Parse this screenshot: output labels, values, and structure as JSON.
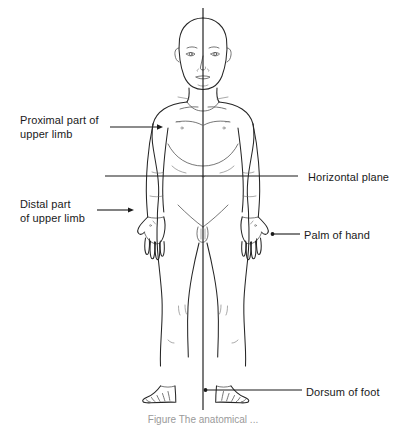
{
  "figure": {
    "type": "anatomical-diagram",
    "background_color": "#ffffff",
    "line_color": "#262626",
    "caption": "Figure   The anatomical ..."
  },
  "labels": {
    "proximal_upper_limb": "Proximal part of\nupper limb",
    "distal_upper_limb": "Distal part\nof upper limb",
    "horizontal_plane": "Horizontal plane",
    "palm_of_hand": "Palm of hand",
    "dorsum_of_foot": "Dorsum of foot"
  },
  "planes": {
    "median_vertical": {
      "name": "median-plane",
      "orientation": "vertical",
      "x": 203,
      "y_start": 8,
      "y_end": 410
    },
    "horizontal": {
      "name": "horizontal-plane",
      "orientation": "horizontal",
      "y": 176,
      "x_start": 105,
      "x_end": 298
    }
  },
  "leaders": [
    {
      "name": "proximal-leader",
      "x1": 110,
      "y1": 127,
      "x2": 158,
      "y2": 127,
      "dot": true
    },
    {
      "name": "distal-leader",
      "x1": 97,
      "y1": 210,
      "x2": 131,
      "y2": 210,
      "dot": true
    },
    {
      "name": "palm-leader",
      "x1": 300,
      "y1": 234,
      "x2": 272,
      "y2": 234,
      "dot": true
    },
    {
      "name": "dorsum-leader",
      "x1": 302,
      "y1": 390,
      "x2": 205,
      "y2": 390,
      "dot": true
    }
  ]
}
